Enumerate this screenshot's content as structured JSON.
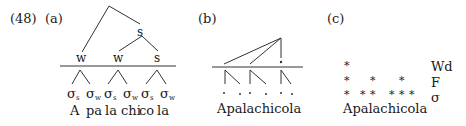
{
  "example_number": "(48)",
  "panels": {
    "a": {
      "label": "(a)",
      "top_nodes": [
        "s"
      ],
      "foot_nodes": [
        "w",
        "w",
        "s"
      ],
      "syllable_labels": [
        {
          "sigma": "σ",
          "sub": "s"
        },
        {
          "sigma": "σ",
          "sub": "w"
        },
        {
          "sigma": "σ",
          "sub": "s"
        },
        {
          "sigma": "σ",
          "sub": "w"
        },
        {
          "sigma": "σ",
          "sub": "s"
        },
        {
          "sigma": "σ",
          "sub": "w"
        }
      ],
      "syllables": [
        "A",
        "pa",
        "la",
        "chi",
        "co",
        "la"
      ]
    },
    "b": {
      "label": "(b)",
      "word": "Apalachicola"
    },
    "c": {
      "label": "(c)",
      "word": "Apalachicola",
      "tiers": [
        {
          "name": "Wd",
          "marks": "*"
        },
        {
          "name": "F",
          "marks": "*    *    *"
        },
        {
          "name": "σ",
          "marks": "*  * *   * * *"
        }
      ]
    }
  }
}
